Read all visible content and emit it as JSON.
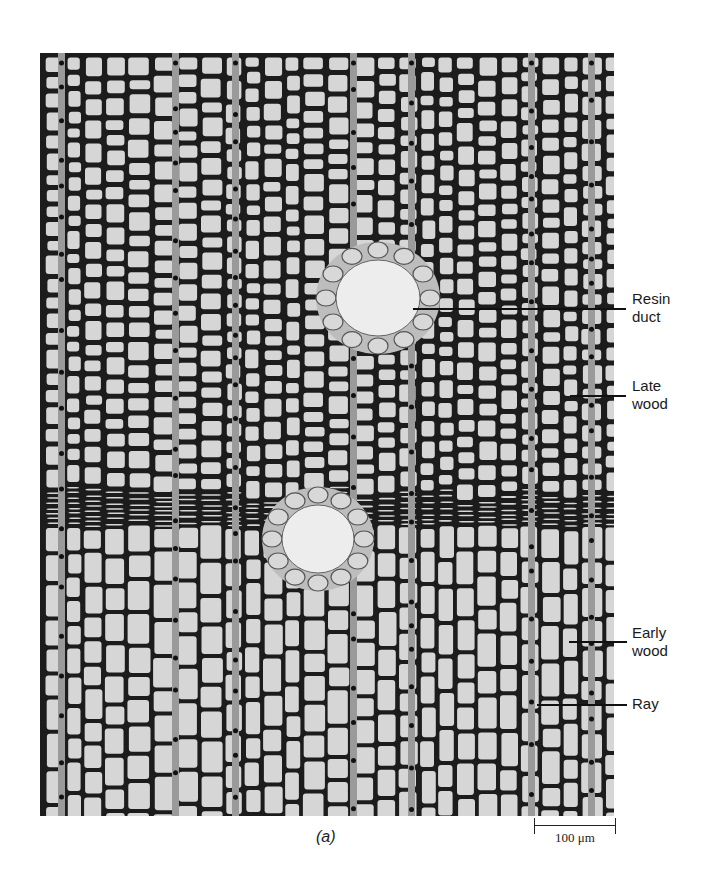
{
  "figure": {
    "panel_label": "(a)",
    "colors": {
      "cell_wall": "#1c1c1c",
      "cell_lumen": "#d6d6d6",
      "background": "#ffffff",
      "leader_line": "#111111"
    }
  },
  "callouts": [
    {
      "id": "resin-duct",
      "label": "Resin\nduct",
      "line": {
        "x1": 413,
        "x2": 626,
        "y": 309
      },
      "label_pos": {
        "x": 632,
        "y": 292
      }
    },
    {
      "id": "late-wood",
      "label": "Late\nwood",
      "line": {
        "x1": 570,
        "x2": 626,
        "y": 396
      },
      "label_pos": {
        "x": 632,
        "y": 378
      }
    },
    {
      "id": "early-wood",
      "label": "Early\nwood",
      "line": {
        "x1": 569,
        "x2": 627,
        "y": 642
      },
      "label_pos": {
        "x": 632,
        "y": 626
      }
    },
    {
      "id": "ray",
      "label": "Ray",
      "line": {
        "x1": 537,
        "x2": 627,
        "y": 705
      },
      "label_pos": {
        "x": 632,
        "y": 696
      }
    }
  ],
  "scale_bar": {
    "label": "100 μm",
    "value": 100,
    "unit": "μm"
  }
}
